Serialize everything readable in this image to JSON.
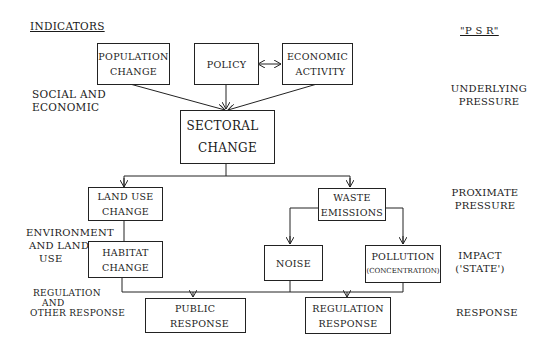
{
  "headers": {
    "indicators": "INDICATORS",
    "psr": "\"P S R\""
  },
  "left_labels": {
    "social": [
      "SOCIAL AND",
      "ECONOMIC"
    ],
    "environment": [
      "ENVIRONMENT",
      "AND LAND",
      "USE"
    ],
    "regulation": [
      "REGULATION",
      "AND",
      "OTHER RESPONSE"
    ]
  },
  "right_labels": {
    "underlying": [
      "UNDERLYING",
      "PRESSURE"
    ],
    "proximate": [
      "PROXIMATE",
      "PRESSURE"
    ],
    "impact": [
      "IMPACT",
      "('STATE')"
    ],
    "response": [
      "RESPONSE"
    ]
  },
  "boxes": {
    "population": [
      "POPULATION",
      "CHANGE"
    ],
    "policy": [
      "POLICY"
    ],
    "economic": [
      "ECONOMIC",
      "ACTIVITY"
    ],
    "sectoral": [
      "SECTORAL",
      "CHANGE"
    ],
    "land_use": [
      "LAND USE",
      "CHANGE"
    ],
    "habitat": [
      "HABITAT",
      "CHANGE"
    ],
    "waste": [
      "WASTE",
      "EMISSIONS"
    ],
    "noise": [
      "NOISE"
    ],
    "pollution": [
      "POLLUTION",
      "(CONCENTRATION)"
    ],
    "public": [
      "PUBLIC",
      "RESPONSE"
    ],
    "regulation": [
      "REGULATION",
      "RESPONSE"
    ]
  }
}
